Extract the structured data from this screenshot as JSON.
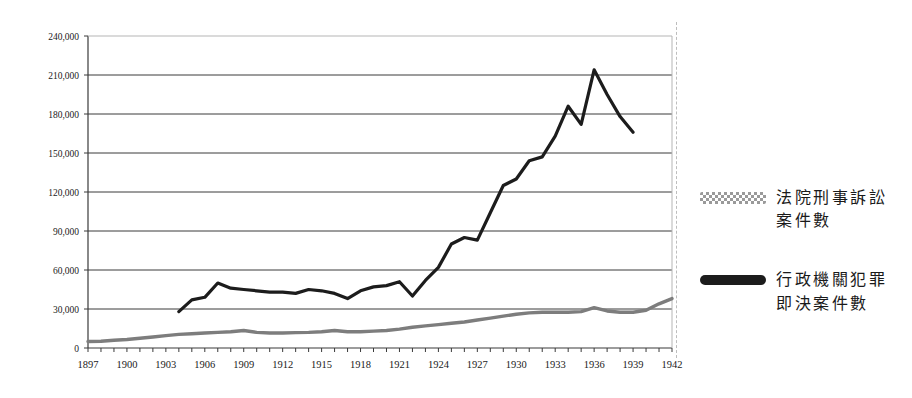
{
  "chart_data": {
    "type": "line",
    "title": "",
    "subtitle": "",
    "xlabel": "",
    "ylabel": "",
    "xlim": [
      1897,
      1942
    ],
    "ylim": [
      0,
      240000
    ],
    "ytick_step": 30000,
    "xtick_step": 1,
    "xtick_label_step": 3,
    "grid": "horizontal",
    "legend_position": "right",
    "ytick_labels": [
      "0",
      "30,000",
      "60,000",
      "90,000",
      "120,000",
      "150,000",
      "180,000",
      "210,000",
      "240,000"
    ],
    "ytick_values": [
      0,
      30000,
      60000,
      90000,
      120000,
      150000,
      180000,
      210000,
      240000
    ],
    "xtick_labels": [
      "1897",
      "1900",
      "1903",
      "1906",
      "1909",
      "1912",
      "1915",
      "1918",
      "1921",
      "1924",
      "1927",
      "1930",
      "1933",
      "1936",
      "1939",
      "1942"
    ],
    "xtick_values": [
      1897,
      1900,
      1903,
      1906,
      1909,
      1912,
      1915,
      1918,
      1921,
      1924,
      1927,
      1930,
      1933,
      1936,
      1939,
      1942
    ],
    "series": [
      {
        "name": "法院刑事訴訟案件數",
        "color": "#7d7d7d",
        "style": "hatched",
        "x": [
          1897,
          1898,
          1899,
          1900,
          1901,
          1902,
          1903,
          1904,
          1905,
          1906,
          1907,
          1908,
          1909,
          1910,
          1911,
          1912,
          1913,
          1914,
          1915,
          1916,
          1917,
          1918,
          1919,
          1920,
          1921,
          1922,
          1923,
          1924,
          1925,
          1926,
          1927,
          1928,
          1929,
          1930,
          1931,
          1932,
          1933,
          1934,
          1935,
          1936,
          1937,
          1938,
          1939,
          1940,
          1941,
          1942
        ],
        "values": [
          5000,
          5200,
          6000,
          6500,
          7500,
          8500,
          9500,
          10500,
          11000,
          11500,
          12000,
          12500,
          13500,
          12000,
          11500,
          11500,
          11800,
          12000,
          12500,
          13500,
          12500,
          12500,
          13000,
          13500,
          14500,
          16000,
          17000,
          18000,
          19000,
          20000,
          21500,
          23000,
          24500,
          26000,
          27000,
          27500,
          27500,
          27500,
          28000,
          31000,
          28500,
          27500,
          27500,
          29000,
          34000,
          38000
        ]
      },
      {
        "name": "行政機關犯罪即決案件數",
        "color": "#1c1c1c",
        "style": "solid",
        "x": [
          1904,
          1905,
          1906,
          1907,
          1908,
          1909,
          1910,
          1911,
          1912,
          1913,
          1914,
          1915,
          1916,
          1917,
          1918,
          1919,
          1920,
          1921,
          1922,
          1923,
          1924,
          1925,
          1926,
          1927,
          1928,
          1929,
          1930,
          1931,
          1932,
          1933,
          1934,
          1935,
          1936,
          1937,
          1938,
          1939
        ],
        "values": [
          28000,
          37000,
          39000,
          50000,
          46000,
          45000,
          44000,
          43000,
          43000,
          42000,
          45000,
          44000,
          42000,
          38000,
          44000,
          47000,
          48000,
          51000,
          40000,
          52000,
          62000,
          80000,
          85000,
          83000,
          104000,
          125000,
          130000,
          144000,
          147000,
          163000,
          186000,
          172000,
          214000,
          195000,
          178000,
          166000
        ]
      }
    ]
  },
  "legend": {
    "entries": [
      {
        "swatch": "hatched-gray-line",
        "label": "法院刑事訴訟案件數"
      },
      {
        "swatch": "solid-black-line",
        "label": "行政機關犯罪即決案件數"
      }
    ]
  }
}
